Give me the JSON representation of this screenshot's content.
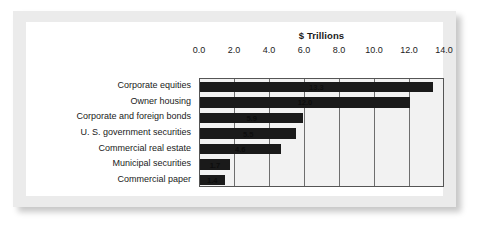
{
  "chart_data": {
    "type": "bar",
    "orientation": "horizontal",
    "title": "$ Trillions",
    "xlabel": "",
    "ylabel": "",
    "categories": [
      "Corporate equities",
      "Owner housing",
      "Corporate and foreign bonds",
      "U. S. government securities",
      "Commercial real estate",
      "Municipal securities",
      "Commercial paper"
    ],
    "values": [
      13.3,
      12.0,
      5.9,
      5.5,
      4.6,
      1.7,
      1.4
    ],
    "value_labels": [
      "13.3",
      "12.0",
      "5.9",
      "5.5",
      "4.6",
      "1.7",
      "1.4"
    ],
    "xlim": [
      0.0,
      14.0
    ],
    "xticks": [
      0.0,
      2.0,
      4.0,
      6.0,
      8.0,
      10.0,
      12.0,
      14.0
    ],
    "xtick_labels": [
      "0.0",
      "2.0",
      "4.0",
      "6.0",
      "8.0",
      "10.0",
      "12.0",
      "14.0"
    ],
    "grid": true,
    "legend": null,
    "bar_color": "#1a1a1a",
    "plot_background": "#f2f2f2",
    "frame_color": "#555555"
  }
}
